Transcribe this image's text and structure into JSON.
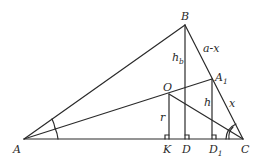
{
  "diagram": {
    "type": "triangle-geometry",
    "points": {
      "A": {
        "label": "A",
        "x": 24,
        "y": 139
      },
      "B": {
        "label": "B",
        "x": 185,
        "y": 25
      },
      "C": {
        "label": "C",
        "x": 243,
        "y": 139
      },
      "A1": {
        "label": "A",
        "sub": "1",
        "x": 212,
        "y": 79
      },
      "O": {
        "label": "O",
        "x": 169,
        "y": 94
      },
      "K": {
        "label": "K",
        "x": 169,
        "y": 139
      },
      "D": {
        "label": "D",
        "x": 185,
        "y": 139
      },
      "D1": {
        "label": "D",
        "sub": "1",
        "x": 212,
        "y": 139
      }
    },
    "segment_labels": {
      "hb": {
        "text": "h",
        "sub": "b"
      },
      "a_minus_x": "a-x",
      "h": "h",
      "x": "x",
      "r": "r"
    },
    "segments": [
      "AB",
      "BC",
      "AC",
      "AA1",
      "OC",
      "BD",
      "OK",
      "A1D1"
    ],
    "right_angles": [
      "K",
      "D",
      "D1"
    ],
    "angle_marks": {
      "A": "single arc (bisected)",
      "C": "double arc"
    }
  }
}
